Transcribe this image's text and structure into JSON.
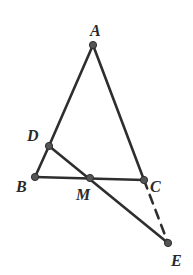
{
  "figure": {
    "type": "geometry",
    "colors": {
      "line": "#2e2e2e",
      "point": "#555555",
      "label": "#2a2a2a",
      "background": "#ffffff"
    },
    "points": {
      "A": {
        "label": "A",
        "x": 93,
        "y": 45,
        "lx": 90,
        "ly": 36
      },
      "B": {
        "label": "B",
        "x": 35,
        "y": 177,
        "lx": 16,
        "ly": 192
      },
      "C": {
        "label": "C",
        "x": 144,
        "y": 180,
        "lx": 150,
        "ly": 192
      },
      "D": {
        "label": "D",
        "x": 49,
        "y": 146,
        "lx": 27,
        "ly": 141
      },
      "M": {
        "label": "M",
        "x": 90,
        "y": 178,
        "lx": 76,
        "ly": 200
      },
      "E": {
        "label": "E",
        "x": 168,
        "y": 243,
        "lx": 171,
        "ly": 266
      }
    },
    "segments": [
      {
        "from": "A",
        "to": "D",
        "style": "solid"
      },
      {
        "from": "D",
        "to": "B",
        "style": "solid"
      },
      {
        "from": "A",
        "to": "C",
        "style": "solid"
      },
      {
        "from": "B",
        "to": "C",
        "style": "solid"
      },
      {
        "from": "D",
        "to": "E",
        "style": "solid"
      },
      {
        "from": "C",
        "to": "E",
        "style": "dashed"
      }
    ]
  }
}
